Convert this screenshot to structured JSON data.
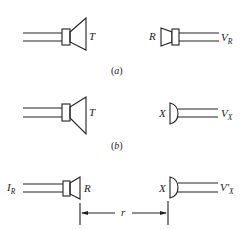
{
  "figure": {
    "panels": [
      {
        "caption": "(a)",
        "caption_letter": "a",
        "left_device": {
          "type": "loudspeaker",
          "label": "T"
        },
        "right_device": {
          "type": "reciprocal-transducer",
          "label": "R",
          "output_label": "V",
          "output_subscript": "R"
        }
      },
      {
        "caption": "(b)",
        "caption_letter": "b",
        "left_device": {
          "type": "loudspeaker",
          "label": "T"
        },
        "right_device": {
          "type": "microphone",
          "label": "X",
          "output_label": "V",
          "output_subscript": "X"
        }
      },
      {
        "left_device": {
          "type": "reciprocal-transducer",
          "label": "R",
          "input_label": "I",
          "input_subscript": "R"
        },
        "right_device": {
          "type": "microphone",
          "label": "X",
          "output_label": "V'",
          "output_subscript": "X"
        },
        "distance_label": "r"
      }
    ]
  },
  "colors": {
    "line": "#222222",
    "background": "#ffffff"
  }
}
